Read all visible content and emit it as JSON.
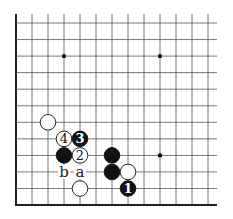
{
  "diagram": {
    "type": "go-board-partial",
    "visible_columns": 13,
    "visible_rows": 12,
    "edges": [
      "left",
      "bottom"
    ],
    "star_points": [
      {
        "col": 3,
        "row": 2
      },
      {
        "col": 9,
        "row": 2
      },
      {
        "col": 9,
        "row": 8
      }
    ],
    "stones": [
      {
        "color": "white",
        "col": 2,
        "row": 6,
        "label": ""
      },
      {
        "color": "white",
        "col": 3,
        "row": 7,
        "label": "4"
      },
      {
        "color": "black",
        "col": 4,
        "row": 7,
        "label": "3"
      },
      {
        "color": "black",
        "col": 3,
        "row": 8,
        "label": ""
      },
      {
        "color": "white",
        "col": 4,
        "row": 8,
        "label": "2"
      },
      {
        "color": "black",
        "col": 6,
        "row": 8,
        "label": ""
      },
      {
        "color": "black",
        "col": 6,
        "row": 9,
        "label": ""
      },
      {
        "color": "white",
        "col": 7,
        "row": 9,
        "label": ""
      },
      {
        "color": "white",
        "col": 4,
        "row": 10,
        "label": ""
      },
      {
        "color": "black",
        "col": 7,
        "row": 10,
        "label": "1"
      }
    ],
    "point_labels": [
      {
        "text": "b",
        "col": 3,
        "row": 9
      },
      {
        "text": "a",
        "col": 4,
        "row": 9
      }
    ],
    "colors": {
      "black_stone": "#111111",
      "white_stone": "#ffffff",
      "grid_line": "#555555",
      "edge_line": "#222222"
    }
  }
}
